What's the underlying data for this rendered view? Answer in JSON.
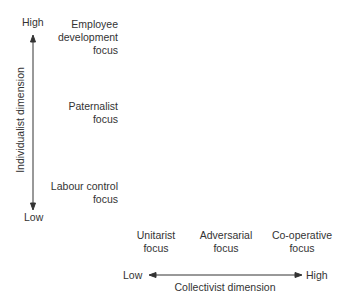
{
  "y_axis": {
    "title": "Individualist dimension",
    "high_label": "High",
    "low_label": "Low",
    "items": [
      {
        "line1": "Employee",
        "line2": "development",
        "line3": "focus"
      },
      {
        "line1": "Paternalist",
        "line2": "focus"
      },
      {
        "line1": "Labour control",
        "line2": "focus"
      }
    ]
  },
  "x_axis": {
    "title": "Collectivist dimension",
    "low_label": "Low",
    "high_label": "High",
    "items": [
      {
        "line1": "Unitarist",
        "line2": "focus"
      },
      {
        "line1": "Adversarial",
        "line2": "focus"
      },
      {
        "line1": "Co-operative",
        "line2": "focus"
      }
    ]
  },
  "colors": {
    "line": "#333333",
    "text": "#333333"
  }
}
